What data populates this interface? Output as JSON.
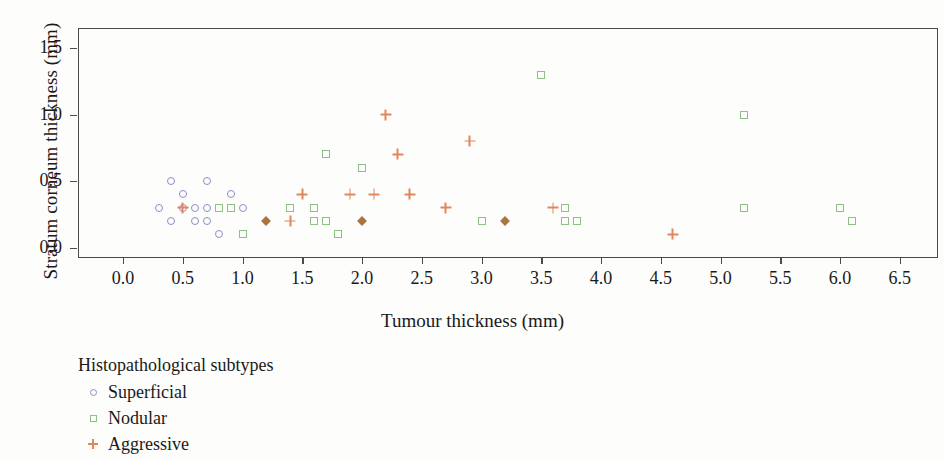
{
  "chart_data": {
    "type": "scatter",
    "title": "",
    "xlabel": "Tumour thickness (mm)",
    "ylabel": "Stratum corneum thickness (mm)",
    "xlim": [
      -0.35,
      6.85
    ],
    "ylim": [
      -0.1,
      1.6
    ],
    "xticks": [
      0.0,
      0.5,
      1.0,
      1.5,
      2.0,
      2.5,
      3.0,
      3.5,
      4.0,
      4.5,
      5.0,
      5.5,
      6.0,
      6.5
    ],
    "xticklabels": [
      "0.0",
      "0.5",
      "1.0",
      "1.5",
      "2.0",
      "2.5",
      "3.0",
      "3.5",
      "4.0",
      "4.5",
      "5.0",
      "5.5",
      "6.0",
      "6.5"
    ],
    "yticks": [
      0.0,
      0.5,
      1.0,
      1.5
    ],
    "yticklabels": [
      "0.0",
      "0.5",
      "1.0",
      "1.5"
    ],
    "grid": false,
    "legend_position": "below-left",
    "legend_title": "Histopathological subtypes",
    "series": [
      {
        "name": "Superficial",
        "marker": "circle",
        "color": "#8e8ec8",
        "points": [
          [
            0.3,
            0.3
          ],
          [
            0.4,
            0.5
          ],
          [
            0.4,
            0.2
          ],
          [
            0.5,
            0.4
          ],
          [
            0.5,
            0.3
          ],
          [
            0.6,
            0.3
          ],
          [
            0.6,
            0.2
          ],
          [
            0.7,
            0.5
          ],
          [
            0.7,
            0.3
          ],
          [
            0.7,
            0.2
          ],
          [
            0.8,
            0.1
          ],
          [
            0.9,
            0.4
          ],
          [
            1.0,
            0.3
          ]
        ]
      },
      {
        "name": "Nodular",
        "marker": "square",
        "color": "#8fbf86",
        "points": [
          [
            0.8,
            0.3
          ],
          [
            0.9,
            0.3
          ],
          [
            1.0,
            0.1
          ],
          [
            1.4,
            0.3
          ],
          [
            1.6,
            0.3
          ],
          [
            1.6,
            0.2
          ],
          [
            1.7,
            0.7
          ],
          [
            1.7,
            0.2
          ],
          [
            1.8,
            0.1
          ],
          [
            2.0,
            0.6
          ],
          [
            3.0,
            0.2
          ],
          [
            3.5,
            1.3
          ],
          [
            3.7,
            0.3
          ],
          [
            3.7,
            0.2
          ],
          [
            3.8,
            0.2
          ],
          [
            5.2,
            1.0
          ],
          [
            5.2,
            0.3
          ],
          [
            6.0,
            0.3
          ],
          [
            6.1,
            0.2
          ]
        ]
      },
      {
        "name": "Aggressive",
        "marker": "plus",
        "color": "#e2875b",
        "points": [
          [
            0.5,
            0.3
          ],
          [
            1.4,
            0.2
          ],
          [
            1.5,
            0.4
          ],
          [
            1.9,
            0.4
          ],
          [
            2.1,
            0.4
          ],
          [
            2.2,
            1.0
          ],
          [
            2.3,
            0.7
          ],
          [
            2.4,
            0.4
          ],
          [
            2.7,
            0.3
          ],
          [
            2.9,
            0.8
          ],
          [
            3.6,
            0.3
          ],
          [
            4.6,
            0.1
          ]
        ]
      },
      {
        "name": "Overlapping",
        "marker": "diamond",
        "color": "#a8743f",
        "points": [
          [
            1.2,
            0.2
          ],
          [
            2.0,
            0.2
          ],
          [
            3.2,
            0.2
          ]
        ]
      }
    ]
  },
  "axes": {
    "x_title": "Tumour thickness (mm)",
    "y_title": "Stratum corneum thickness (mm)"
  },
  "legend": {
    "title": "Histopathological subtypes",
    "items": [
      {
        "label": "Superficial",
        "marker": "circle-marker"
      },
      {
        "label": "Nodular",
        "marker": "square-marker"
      },
      {
        "label": "Aggressive",
        "marker": "plus-marker"
      }
    ]
  }
}
